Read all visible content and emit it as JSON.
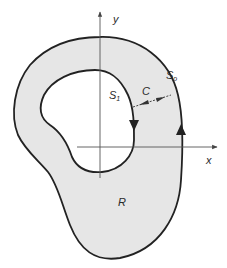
{
  "diagram": {
    "type": "multiply-connected-region",
    "colors": {
      "region_fill": "#e6e6e6",
      "stroke": "#222222",
      "axis": "#555555",
      "background": "#ffffff"
    },
    "labels": {
      "y_axis": "y",
      "x_axis": "x",
      "outer_boundary": "S",
      "outer_boundary_sub": "o",
      "inner_boundary": "S",
      "inner_boundary_sub": "1",
      "cut": "C",
      "region": "R"
    },
    "elements": [
      {
        "id": "outer_boundary",
        "label": "S_o",
        "orientation": "counterclockwise (arrow pointing up on right side)"
      },
      {
        "id": "inner_boundary",
        "label": "S_1",
        "orientation": "clockwise (arrow pointing down on right side)"
      },
      {
        "id": "cut",
        "label": "C",
        "style": "dashed line with arrows in both directions connecting S_1 to S_o"
      },
      {
        "id": "region",
        "label": "R",
        "style": "shaded area between S_1 and S_o"
      }
    ]
  }
}
